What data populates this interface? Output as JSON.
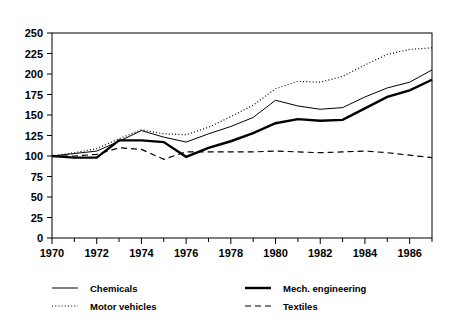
{
  "chart_data": {
    "type": "line",
    "title": "",
    "subtitle": "",
    "xlabel": "",
    "ylabel": "",
    "xlim": [
      1970,
      1987
    ],
    "ylim": [
      0,
      250
    ],
    "grid": false,
    "legend_position": "bottom",
    "x": [
      1970,
      1971,
      1972,
      1973,
      1974,
      1975,
      1976,
      1977,
      1978,
      1979,
      1980,
      1981,
      1982,
      1983,
      1984,
      1985,
      1986,
      1987
    ],
    "xticks": [
      1970,
      1972,
      1974,
      1976,
      1978,
      1980,
      1982,
      1984,
      1986
    ],
    "xtick_labels": [
      "1970",
      "1972",
      "1974",
      "1976",
      "1978",
      "1980",
      "1982",
      "1984",
      "1986"
    ],
    "yticks": [
      0,
      25,
      50,
      75,
      100,
      125,
      150,
      175,
      200,
      225,
      250
    ],
    "ytick_labels": [
      "0",
      "25",
      "50",
      "75",
      "100",
      "125",
      "150",
      "175",
      "200",
      "225",
      "250"
    ],
    "series": [
      {
        "name": "Chemicals",
        "style": "solid-thin",
        "color": "#000000",
        "values": [
          100,
          103,
          106,
          118,
          131,
          123,
          117,
          127,
          136,
          147,
          168,
          161,
          157,
          159,
          172,
          183,
          190,
          205
        ]
      },
      {
        "name": "Motor vehicles",
        "style": "dotted",
        "color": "#000000",
        "values": [
          100,
          104,
          109,
          121,
          132,
          127,
          126,
          135,
          148,
          162,
          182,
          191,
          190,
          197,
          211,
          224,
          230,
          232
        ]
      },
      {
        "name": "Mech. engineering",
        "style": "solid-thick",
        "color": "#000000",
        "values": [
          100,
          98,
          98,
          119,
          119,
          117,
          99,
          110,
          118,
          128,
          140,
          145,
          143,
          144,
          158,
          172,
          180,
          193
        ]
      },
      {
        "name": "Textiles",
        "style": "dashed",
        "color": "#000000",
        "values": [
          100,
          100,
          102,
          110,
          108,
          96,
          105,
          105,
          105,
          105,
          106,
          105,
          104,
          105,
          106,
          104,
          101,
          98
        ]
      }
    ]
  },
  "legend": {
    "items": [
      {
        "label": "Chemicals",
        "swatch": "solid-thin-swatch"
      },
      {
        "label": "Mech. engineering",
        "swatch": "solid-thick-swatch"
      },
      {
        "label": "Motor vehicles",
        "swatch": "dotted-swatch"
      },
      {
        "label": "Textiles",
        "swatch": "dashed-swatch"
      }
    ]
  }
}
